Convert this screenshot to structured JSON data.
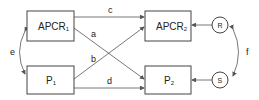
{
  "diagram": {
    "nodes": {
      "apcr1": {
        "main": "APCR",
        "sub": "1"
      },
      "p1": {
        "main": "P",
        "sub": "1"
      },
      "apcr2": {
        "main": "APCR",
        "sub": "2"
      },
      "p2": {
        "main": "P",
        "sub": "2"
      },
      "r": {
        "label": "R"
      },
      "s": {
        "label": "S"
      }
    },
    "paths": {
      "a": "a",
      "b": "b",
      "c": "c",
      "d": "d",
      "e": "e",
      "f": "f"
    },
    "colors": {
      "stroke": "#444444",
      "text": "#222222",
      "background": "#ffffff"
    }
  }
}
